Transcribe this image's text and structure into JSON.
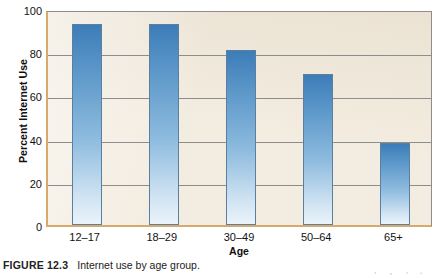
{
  "figure": {
    "caption_label": "FIGURE 12.3",
    "caption_text": "Internet use by age group."
  },
  "chart_data": {
    "type": "bar",
    "title": "",
    "subtitle": "",
    "xlabel": "Age",
    "ylabel": "Percent Internet Use",
    "categories": [
      "12–17",
      "18–29",
      "30–49",
      "50–64",
      "65+"
    ],
    "values": [
      93,
      93,
      81,
      70,
      38
    ],
    "ylim": [
      0,
      100
    ],
    "yticks": [
      0,
      20,
      40,
      60,
      80,
      100
    ],
    "ytick_labels": [
      "0",
      "20",
      "40",
      "60",
      "80",
      "100"
    ],
    "grid": true,
    "grid_axis": "y",
    "legend": false,
    "legend_position": "none",
    "series": [
      {
        "name": "Percent Internet Use",
        "values": [
          93,
          93,
          81,
          70,
          38
        ]
      }
    ],
    "colors": {
      "bar_top": "#3c7cb8",
      "bar_bottom": "#eaf3fa",
      "bar_border": "#5d7f9e",
      "plot_background": "#f3ece0",
      "gridline": "#8d8d8d",
      "axis_line": "#d9a96b",
      "text": "#111111"
    }
  }
}
